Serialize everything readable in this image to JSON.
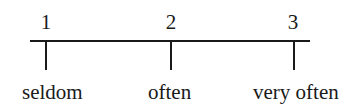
{
  "scale": {
    "points": [
      {
        "value": "1",
        "label": "seldom"
      },
      {
        "value": "2",
        "label": "often"
      },
      {
        "value": "3",
        "label": "very often"
      }
    ]
  }
}
